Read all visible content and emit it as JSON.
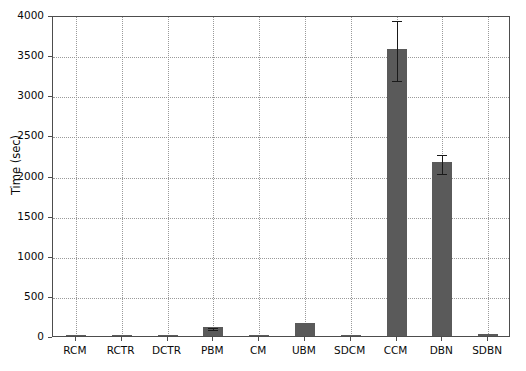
{
  "chart_data": {
    "type": "bar",
    "title": "",
    "xlabel": "",
    "ylabel": "Time (sec)",
    "categories": [
      "RCM",
      "RCTR",
      "DCTR",
      "PBM",
      "CM",
      "UBM",
      "SDCM",
      "CCM",
      "DBN",
      "SDBN"
    ],
    "values": [
      6,
      6,
      7,
      110,
      9,
      160,
      14,
      3575,
      2165,
      20
    ],
    "errors": [
      0,
      0,
      0,
      12,
      0,
      0,
      0,
      375,
      120,
      0
    ],
    "ylim": [
      0,
      4000
    ],
    "yticks": [
      0,
      500,
      1000,
      1500,
      2000,
      2500,
      3000,
      3500,
      4000
    ],
    "ytick_labels": [
      "0",
      "500",
      "1000",
      "1500",
      "2000",
      "2500",
      "3000",
      "3500",
      "4000"
    ],
    "grid": true,
    "grid_style": "dotted",
    "legend": "none",
    "bar_color": "#5a5a5a",
    "error_color": "#1a1a1a",
    "axis_color": "#4d4d4d",
    "background": "#ffffff"
  }
}
